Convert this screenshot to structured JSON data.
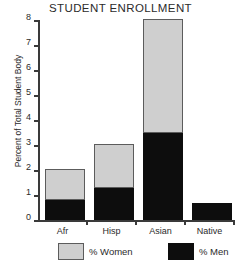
{
  "chart_data": {
    "type": "bar",
    "subtype": "stacked-bar",
    "title": "STUDENT ENROLLMENT",
    "xlabel": "",
    "ylabel": "Percent of Total Student Body",
    "categories": [
      "Afr",
      "Hisp",
      "Asian",
      "Native"
    ],
    "series": [
      {
        "name": "% Men",
        "color": "#0d0d0d",
        "values": [
          0.8,
          1.3,
          3.5,
          0.7
        ]
      },
      {
        "name": "% Women",
        "color": "#cfcfcf",
        "values": [
          1.2,
          1.7,
          4.5,
          0.0
        ]
      }
    ],
    "totals": [
      2.0,
      3.0,
      8.0,
      0.7
    ],
    "ylim": [
      0,
      8
    ],
    "yticks": [
      "0",
      "1",
      "2",
      "3",
      "4",
      "5",
      "6",
      "7",
      "8"
    ],
    "ytick_values": [
      0,
      1,
      2,
      3,
      4,
      5,
      6,
      7,
      8
    ],
    "grid": false,
    "legend_position": "bottom",
    "legend": [
      {
        "label": "% Women",
        "swatch": "light-gray"
      },
      {
        "label": "% Men",
        "swatch": "black"
      }
    ]
  }
}
